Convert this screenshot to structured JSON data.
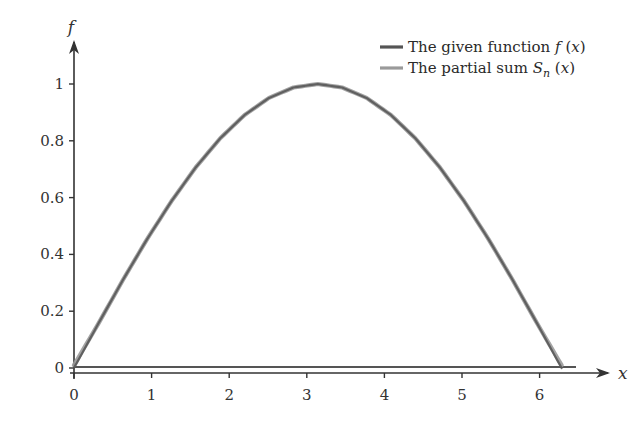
{
  "chart_data": {
    "type": "line",
    "title": "",
    "xlabel": "x",
    "ylabel": "f",
    "xlim": [
      0,
      6.5
    ],
    "ylim": [
      0,
      1.05
    ],
    "xticks": [
      0,
      1,
      2,
      3,
      4,
      5,
      6
    ],
    "xtick_labels": [
      "0",
      "1",
      "2",
      "3",
      "4",
      "5",
      "6"
    ],
    "yticks": [
      0,
      0.2,
      0.4,
      0.6,
      0.8,
      1
    ],
    "ytick_labels": [
      "0",
      "0.2",
      "0.4",
      "0.6",
      "0.8",
      "1"
    ],
    "grid": false,
    "legend_position": "top-right",
    "x": [
      0,
      0.3142,
      0.6283,
      0.9425,
      1.2566,
      1.5708,
      1.885,
      2.1991,
      2.5133,
      2.8274,
      3.1416,
      3.4558,
      3.7699,
      4.0841,
      4.3982,
      4.7124,
      5.0265,
      5.3407,
      5.6549,
      5.969,
      6.2832
    ],
    "series": [
      {
        "name": "The given function f (x)",
        "color": "#555555",
        "values": [
          0,
          0.1564,
          0.309,
          0.454,
          0.5878,
          0.7071,
          0.809,
          0.891,
          0.9511,
          0.9877,
          1.0,
          0.9877,
          0.9511,
          0.891,
          0.809,
          0.7071,
          0.5878,
          0.454,
          0.309,
          0.1564,
          0
        ]
      },
      {
        "name": "The partial sum S_n (x)",
        "color": "#9a9a9a",
        "values": [
          0.01,
          0.1564,
          0.309,
          0.454,
          0.5878,
          0.7071,
          0.809,
          0.891,
          0.9511,
          0.9877,
          1.0,
          0.9877,
          0.9511,
          0.891,
          0.809,
          0.7071,
          0.5878,
          0.454,
          0.309,
          0.1564,
          0.01
        ]
      }
    ],
    "annotations": [
      "horizontal reference line at f = 0"
    ]
  },
  "legend": {
    "items": [
      {
        "text": "The given function ",
        "math": "f",
        "suffix": " (x)",
        "color": "#555555"
      },
      {
        "text": "The partial sum ",
        "math": "S",
        "sub": "n",
        "suffix": " (x)",
        "color": "#9a9a9a"
      }
    ]
  },
  "axes": {
    "x_label": "x",
    "y_label": "f"
  }
}
